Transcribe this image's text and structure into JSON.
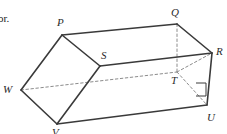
{
  "figure": {
    "kind": "oblique-triangular-prism-diagram",
    "colors": {
      "background": "#ffffff",
      "solid_edge": "#3a3a3a",
      "hidden_edge": "#8c8c8c",
      "label_text": "#2b2b2b",
      "body_text": "#1d1d1d"
    },
    "stroke": {
      "solid_width": 1.6,
      "hidden_width": 1.0,
      "hidden_dash": "2.5 2.5"
    },
    "vertices": [
      {
        "id": "P",
        "label": "P",
        "x": 62,
        "y": 35,
        "label_x": 57,
        "label_y": 17,
        "hidden": false
      },
      {
        "id": "Q",
        "label": "Q",
        "x": 177,
        "y": 24,
        "label_x": 171,
        "label_y": 7,
        "hidden": false
      },
      {
        "id": "R",
        "label": "R",
        "x": 212,
        "y": 53,
        "label_x": 216,
        "label_y": 46,
        "hidden": false
      },
      {
        "id": "S",
        "label": "S",
        "x": 100,
        "y": 66,
        "label_x": 101,
        "label_y": 50,
        "hidden": false
      },
      {
        "id": "T",
        "label": "T",
        "x": 177,
        "y": 72,
        "label_x": 171,
        "label_y": 75,
        "hidden": true
      },
      {
        "id": "U",
        "label": "U",
        "x": 207,
        "y": 105,
        "label_x": 207,
        "label_y": 112,
        "hidden": false
      },
      {
        "id": "V",
        "label": "V",
        "x": 57,
        "y": 124,
        "label_x": 52,
        "label_y": 127,
        "hidden": false
      },
      {
        "id": "W",
        "label": "W",
        "x": 21,
        "y": 90,
        "label_x": 3,
        "label_y": 84,
        "hidden": false
      }
    ],
    "solid_edges": [
      {
        "name": "edge-P-Q",
        "from": "P",
        "to": "Q"
      },
      {
        "name": "edge-Q-R",
        "from": "Q",
        "to": "R"
      },
      {
        "name": "edge-S-R",
        "from": "S",
        "to": "R"
      },
      {
        "name": "edge-P-S",
        "from": "P",
        "to": "S"
      },
      {
        "name": "edge-P-W",
        "from": "P",
        "to": "W"
      },
      {
        "name": "edge-W-V",
        "from": "W",
        "to": "V"
      },
      {
        "name": "edge-V-S",
        "from": "V",
        "to": "S"
      },
      {
        "name": "edge-V-U",
        "from": "V",
        "to": "U"
      },
      {
        "name": "edge-R-U",
        "from": "R",
        "to": "U"
      }
    ],
    "hidden_edges": [
      {
        "name": "edge-W-T",
        "from": "W",
        "to": "T"
      },
      {
        "name": "edge-Q-T",
        "from": "Q",
        "to": "T"
      },
      {
        "name": "edge-T-U",
        "from": "T",
        "to": "U"
      },
      {
        "name": "edge-T-R",
        "from": "T",
        "to": "R"
      }
    ],
    "right_angle_marker": {
      "name": "right-angle-marker-at-U",
      "at_vertex": "U",
      "points": "196,83 206,83 206,96 196,96"
    }
  },
  "page_text": {
    "cropped_left_fragment": "or."
  }
}
